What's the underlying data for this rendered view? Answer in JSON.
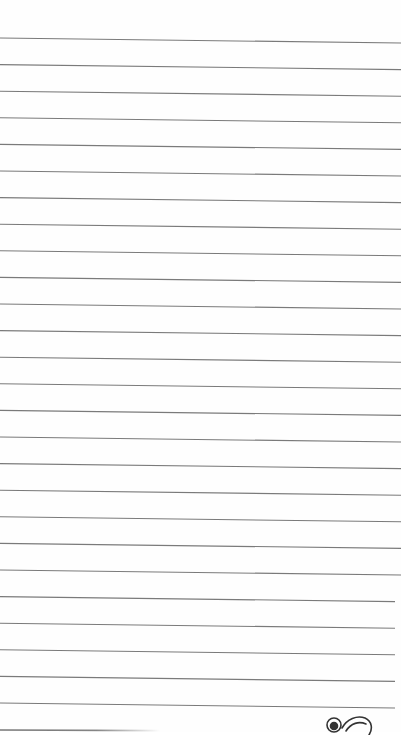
{
  "page": {
    "type": "lined-paper",
    "background_color": "#fefefe",
    "line_color": "#7a7a7a",
    "line_count": 27,
    "line_spacing_px": 26.6,
    "first_line_left_y": 38,
    "first_line_right_y": 43,
    "last_line_partial": true
  },
  "decoration": {
    "icon": "doodle-ornament-icon",
    "position": "bottom-right"
  }
}
